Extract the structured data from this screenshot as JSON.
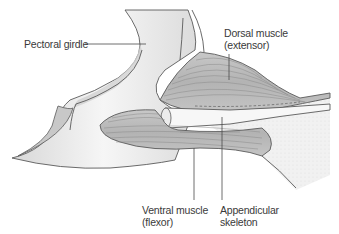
{
  "diagram": {
    "labels": {
      "pectoral_girdle": "Pectoral girdle",
      "dorsal_muscle_line1": "Dorsal muscle",
      "dorsal_muscle_line2": "(extensor)",
      "ventral_muscle_line1": "Ventral muscle",
      "ventral_muscle_line2": "(flexor)",
      "appendicular_line1": "Appendicular",
      "appendicular_line2": "skeleton"
    },
    "colors": {
      "background": "#ffffff",
      "outline": "#5a5a5a",
      "bone_fill": "#ececec",
      "muscle_fill": "#bdbdbd",
      "muscle_striation": "#8a8a8a",
      "fin_fill": "#f2f2f2",
      "label_text": "#3a3a3a",
      "leader_line": "#4a4a4a"
    }
  }
}
